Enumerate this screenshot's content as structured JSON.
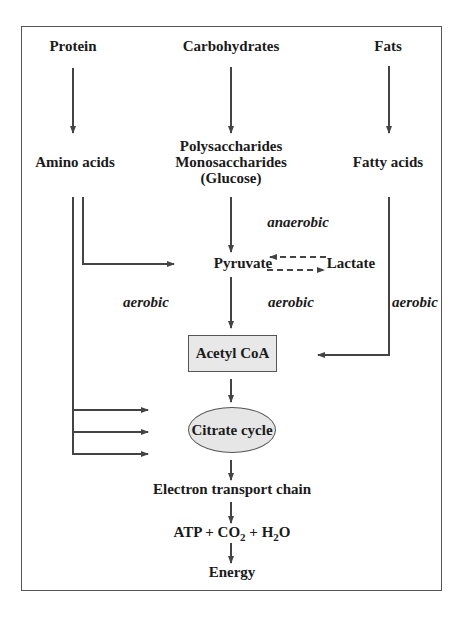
{
  "diagram": {
    "sources": {
      "protein": "Protein",
      "carbohydrates": "Carbohydrates",
      "fats": "Fats"
    },
    "intermediates": {
      "amino_acids": "Amino acids",
      "polysaccharides": "Polysaccharides",
      "monosaccharides": "Monosaccharides",
      "glucose": "(Glucose)",
      "fatty_acids": "Fatty acids",
      "pyruvate": "Pyruvate",
      "lactate": "Lactate",
      "acetyl_coa": "Acetyl CoA",
      "citrate_cycle": "Citrate cycle",
      "etc": "Electron transport chain",
      "products": {
        "atp": "ATP + CO",
        "co2_sub": "2",
        "plus_h": " + H",
        "h2o_sub": "2",
        "o": "O"
      },
      "energy": "Energy"
    },
    "annotations": {
      "anaerobic": "anaerobic",
      "aerobic_left": "aerobic",
      "aerobic_center": "aerobic",
      "aerobic_right": "aerobic"
    },
    "colors": {
      "line": "#444444",
      "box_fill": "#e8e8e8",
      "frame": "#555555"
    }
  }
}
